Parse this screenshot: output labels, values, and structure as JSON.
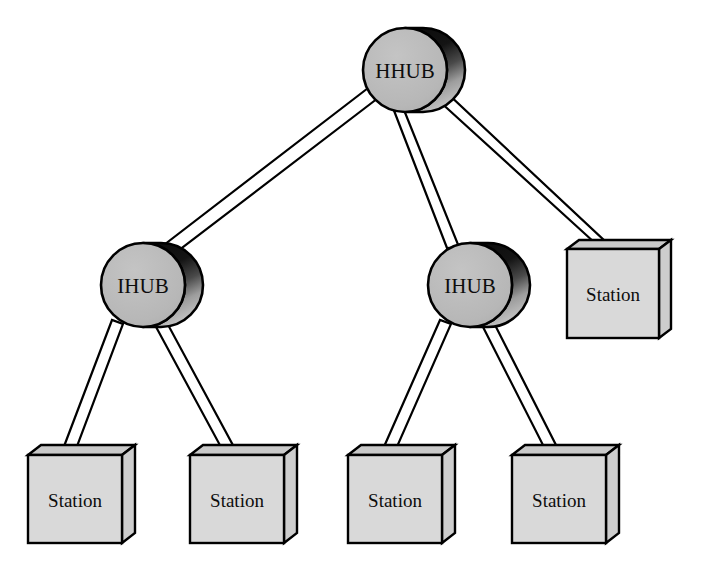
{
  "diagram": {
    "type": "network-topology-tree",
    "background_color": "#ffffff",
    "colors": {
      "node_face": "#b9b9b9",
      "node_outline": "#000000",
      "cylinder_shadow_dark": "#121212",
      "cylinder_shadow_light": "#9a9a9a",
      "box_face": "#d9d9d9",
      "box_top": "#c9c9c9",
      "box_side": "#cfcfcf",
      "link_stroke": "#000000",
      "link_fill": "#ffffff",
      "label_color": "#0d0d0d"
    },
    "nodes": [
      {
        "id": "hhub",
        "label": "HHUB",
        "shape": "cylinder",
        "role": "head-hub",
        "cx": 405,
        "cy": 70,
        "r": 42
      },
      {
        "id": "ihub-left",
        "label": "IHUB",
        "shape": "cylinder",
        "role": "intermediate-hub",
        "cx": 143,
        "cy": 285,
        "r": 42
      },
      {
        "id": "ihub-right",
        "label": "IHUB",
        "shape": "cylinder",
        "role": "intermediate-hub",
        "cx": 470,
        "cy": 285,
        "r": 42
      },
      {
        "id": "station-hhub-right",
        "label": "Station",
        "shape": "box3d",
        "role": "station",
        "x": 567,
        "y": 242,
        "w": 92,
        "h": 92
      },
      {
        "id": "station-l1",
        "label": "Station",
        "shape": "box3d",
        "role": "station",
        "x": 28,
        "y": 447,
        "w": 94,
        "h": 93
      },
      {
        "id": "station-l2",
        "label": "Station",
        "shape": "box3d",
        "role": "station",
        "x": 190,
        "y": 447,
        "w": 94,
        "h": 93
      },
      {
        "id": "station-r1",
        "label": "Station",
        "shape": "box3d",
        "role": "station",
        "x": 348,
        "y": 447,
        "w": 94,
        "h": 93
      },
      {
        "id": "station-r2",
        "label": "Station",
        "shape": "box3d",
        "role": "station",
        "x": 512,
        "y": 447,
        "w": 94,
        "h": 93
      }
    ],
    "links": [
      {
        "id": "link-hhub-ihub-left",
        "from": "hhub",
        "to": "ihub-left",
        "style": "ribbon"
      },
      {
        "id": "link-hhub-ihub-right",
        "from": "hhub",
        "to": "ihub-right",
        "style": "ribbon"
      },
      {
        "id": "link-hhub-station",
        "from": "hhub",
        "to": "station-hhub-right",
        "style": "ribbon"
      },
      {
        "id": "link-ihub-left-s1",
        "from": "ihub-left",
        "to": "station-l1",
        "style": "ribbon"
      },
      {
        "id": "link-ihub-left-s2",
        "from": "ihub-left",
        "to": "station-l2",
        "style": "ribbon"
      },
      {
        "id": "link-ihub-right-s1",
        "from": "ihub-right",
        "to": "station-r1",
        "style": "ribbon"
      },
      {
        "id": "link-ihub-right-s2",
        "from": "ihub-right",
        "to": "station-r2",
        "style": "ribbon"
      }
    ]
  }
}
